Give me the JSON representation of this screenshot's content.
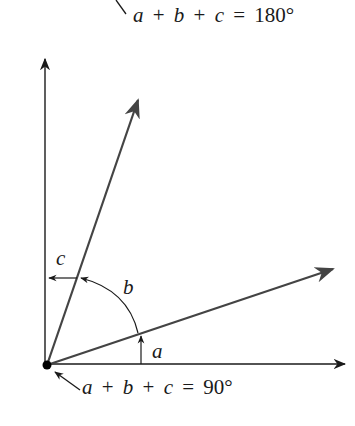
{
  "diagram": {
    "type": "angle-diagram",
    "colors": {
      "background": "#ffffff",
      "axis": "#1a1a1a",
      "ray": "#444444",
      "text": "#1a1a1a"
    },
    "top_formula": {
      "a": "a",
      "plus1": "+",
      "b": "b",
      "plus2": "+",
      "c": "c",
      "eq": "=",
      "value": "180°"
    },
    "bottom_formula": {
      "a": "a",
      "plus1": "+",
      "b": "b",
      "plus2": "+",
      "c": "c",
      "eq": "=",
      "value": "90°"
    },
    "angle_labels": {
      "a": "a",
      "b": "b",
      "c": "c"
    },
    "geometry": {
      "origin": [
        47,
        365
      ],
      "vertical_axis_tip": [
        45,
        59
      ],
      "horizontal_axis_tip": [
        345,
        364
      ],
      "steep_ray_tip": [
        138,
        100
      ],
      "shallow_ray_tip": [
        333,
        269
      ]
    }
  }
}
